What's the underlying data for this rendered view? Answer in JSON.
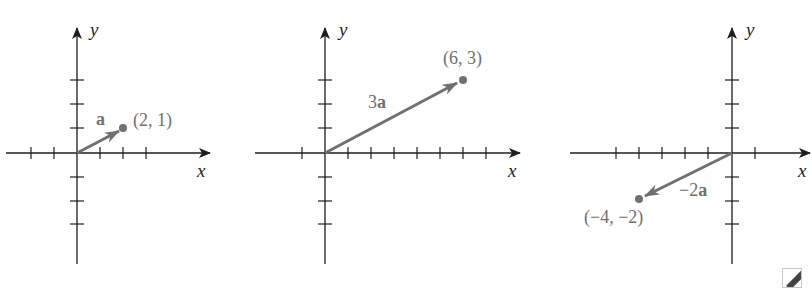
{
  "figure": {
    "panels": [
      {
        "id": "panel-a",
        "axis_labels": {
          "x": "x",
          "y": "y"
        },
        "vector_label": {
          "coef": "",
          "bold": "a"
        },
        "point_label": "(2, 1)",
        "endpoint": [
          2,
          1
        ]
      },
      {
        "id": "panel-3a",
        "axis_labels": {
          "x": "x",
          "y": "y"
        },
        "vector_label": {
          "coef": "3",
          "bold": "a"
        },
        "point_label": "(6, 3)",
        "endpoint": [
          6,
          3
        ]
      },
      {
        "id": "panel-neg2a",
        "axis_labels": {
          "x": "x",
          "y": "y"
        },
        "vector_label": {
          "coef": "−2",
          "bold": "a"
        },
        "point_label": "(−4, −2)",
        "endpoint": [
          -4,
          -2
        ]
      }
    ]
  },
  "colors": {
    "axis": "#1e1e1e",
    "vector": "#707070"
  },
  "icons": {
    "corner": "expand-icon"
  }
}
